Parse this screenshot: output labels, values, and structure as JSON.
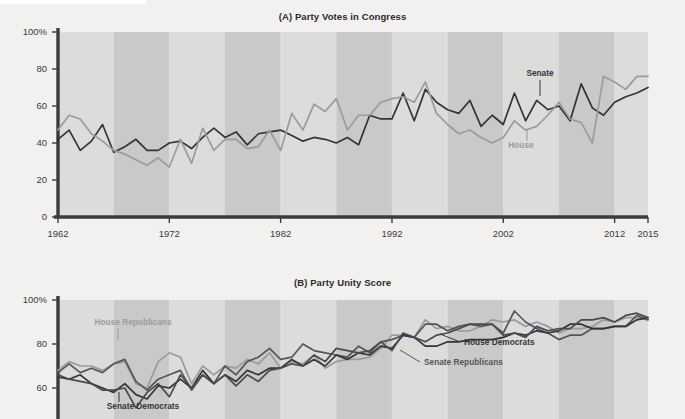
{
  "figure": {
    "background_color": "#f2f1ef",
    "band_light": "#dcdcda",
    "band_dark": "#c9c9c7",
    "axis_color": "#3b3b3b"
  },
  "panel_a": {
    "title": "(A) Party Votes in Congress",
    "y_ticks": [
      "100%",
      "80",
      "60",
      "40",
      "20",
      "0"
    ],
    "x_ticks": [
      "1962",
      "1972",
      "1982",
      "1992",
      "2002",
      "2012",
      "2015"
    ],
    "annotations": [
      {
        "name": "senate-label",
        "text": "Senate",
        "color": "#33333a"
      },
      {
        "name": "house-label",
        "text": "House",
        "color": "#9b9b9b"
      }
    ]
  },
  "panel_b": {
    "title": "(B) Party Unity Score",
    "y_ticks": [
      "100%",
      "80",
      "60",
      "40"
    ],
    "annotations": [
      {
        "name": "house-republicans-label",
        "text": "House Republicans",
        "color": "#9b9b9b"
      },
      {
        "name": "senate-democrats-label",
        "text": "Senate Democrats",
        "color": "#33333a"
      },
      {
        "name": "senate-republicans-label",
        "text": "Senate Republicans",
        "color": "#55555c"
      },
      {
        "name": "house-democrats-label",
        "text": "House Democrats",
        "color": "#33333a"
      }
    ]
  },
  "chart_data": [
    {
      "id": "panel_a",
      "type": "line",
      "title": "(A) Party Votes in Congress",
      "xlabel": "",
      "ylabel": "",
      "xlim": [
        1962,
        2015
      ],
      "ylim": [
        0,
        100
      ],
      "grid": false,
      "legend": "inline-annotation",
      "x": [
        1962,
        1963,
        1964,
        1965,
        1966,
        1967,
        1968,
        1969,
        1970,
        1971,
        1972,
        1973,
        1974,
        1975,
        1976,
        1977,
        1978,
        1979,
        1980,
        1981,
        1982,
        1983,
        1984,
        1985,
        1986,
        1987,
        1988,
        1989,
        1990,
        1991,
        1992,
        1993,
        1994,
        1995,
        1996,
        1997,
        1998,
        1999,
        2000,
        2001,
        2002,
        2003,
        2004,
        2005,
        2006,
        2007,
        2008,
        2009,
        2010,
        2011,
        2012,
        2013,
        2014,
        2015
      ],
      "series": [
        {
          "name": "Senate",
          "color": "#33333a",
          "values": [
            42,
            47,
            36,
            41,
            50,
            35,
            38,
            42,
            36,
            36,
            40,
            41,
            37,
            43,
            48,
            43,
            46,
            39,
            45,
            46,
            47,
            44,
            41,
            43,
            42,
            40,
            43,
            39,
            55,
            53,
            53,
            67,
            52,
            69,
            62,
            58,
            56,
            63,
            49,
            55,
            50,
            67,
            52,
            63,
            58,
            60,
            52,
            72,
            59,
            55,
            62,
            65,
            67,
            70
          ]
        },
        {
          "name": "House",
          "color": "#9b9b9b",
          "values": [
            47,
            55,
            53,
            45,
            41,
            36,
            34,
            31,
            28,
            32,
            27,
            42,
            29,
            48,
            36,
            42,
            42,
            37,
            38,
            47,
            36,
            56,
            47,
            61,
            57,
            64,
            47,
            55,
            55,
            62,
            64,
            65,
            62,
            73,
            56,
            50,
            45,
            47,
            43,
            40,
            43,
            52,
            47,
            49,
            55,
            62,
            53,
            51,
            40,
            76,
            73,
            69,
            76,
            76
          ]
        }
      ]
    },
    {
      "id": "panel_b",
      "type": "line",
      "title": "(B) Party Unity Score",
      "xlabel": "",
      "ylabel": "",
      "xlim": [
        1962,
        2015
      ],
      "ylim": [
        30,
        100
      ],
      "grid": false,
      "legend": "inline-annotation",
      "x": [
        1962,
        1963,
        1964,
        1965,
        1966,
        1967,
        1968,
        1969,
        1970,
        1971,
        1972,
        1973,
        1974,
        1975,
        1976,
        1977,
        1978,
        1979,
        1980,
        1981,
        1982,
        1983,
        1984,
        1985,
        1986,
        1987,
        1988,
        1989,
        1990,
        1991,
        1992,
        1993,
        1994,
        1995,
        1996,
        1997,
        1998,
        1999,
        2000,
        2001,
        2002,
        2003,
        2004,
        2005,
        2006,
        2007,
        2008,
        2009,
        2010,
        2011,
        2012,
        2013,
        2014,
        2015
      ],
      "series": [
        {
          "name": "House Republicans",
          "color": "#9b9b9b",
          "values": [
            68,
            72,
            70,
            70,
            68,
            71,
            72,
            62,
            60,
            72,
            76,
            74,
            62,
            70,
            66,
            70,
            69,
            73,
            71,
            76,
            69,
            72,
            71,
            75,
            69,
            72,
            73,
            73,
            74,
            78,
            84,
            84,
            83,
            91,
            87,
            88,
            86,
            86,
            88,
            91,
            90,
            91,
            88,
            90,
            88,
            85,
            87,
            87,
            88,
            91,
            90,
            92,
            92,
            91
          ]
        },
        {
          "name": "Senate Republicans",
          "color": "#55555c",
          "values": [
            67,
            71,
            67,
            69,
            67,
            71,
            73,
            63,
            59,
            64,
            66,
            68,
            59,
            66,
            62,
            70,
            66,
            72,
            74,
            78,
            73,
            74,
            80,
            77,
            76,
            75,
            74,
            79,
            76,
            81,
            82,
            84,
            83,
            89,
            89,
            86,
            88,
            89,
            88,
            89,
            85,
            95,
            90,
            87,
            85,
            82,
            84,
            84,
            87,
            87,
            88,
            88,
            93,
            91
          ]
        },
        {
          "name": "House Democrats",
          "color": "#33333a",
          "values": [
            65,
            64,
            66,
            62,
            60,
            58,
            62,
            57,
            55,
            61,
            60,
            64,
            60,
            68,
            62,
            66,
            63,
            68,
            66,
            69,
            69,
            73,
            70,
            73,
            70,
            75,
            73,
            76,
            75,
            79,
            78,
            84,
            83,
            79,
            79,
            81,
            81,
            82,
            82,
            82,
            83,
            85,
            84,
            86,
            85,
            86,
            89,
            89,
            87,
            87,
            88,
            88,
            91,
            92
          ]
        },
        {
          "name": "Senate Democrats",
          "color": "#4a4a52",
          "values": [
            66,
            64,
            63,
            62,
            59,
            59,
            60,
            51,
            58,
            62,
            56,
            66,
            60,
            66,
            62,
            66,
            61,
            66,
            63,
            68,
            69,
            71,
            70,
            75,
            72,
            78,
            77,
            76,
            77,
            81,
            77,
            85,
            83,
            81,
            84,
            85,
            87,
            89,
            89,
            89,
            84,
            85,
            83,
            88,
            86,
            87,
            87,
            91,
            91,
            92,
            90,
            93,
            94,
            92
          ]
        }
      ]
    }
  ]
}
